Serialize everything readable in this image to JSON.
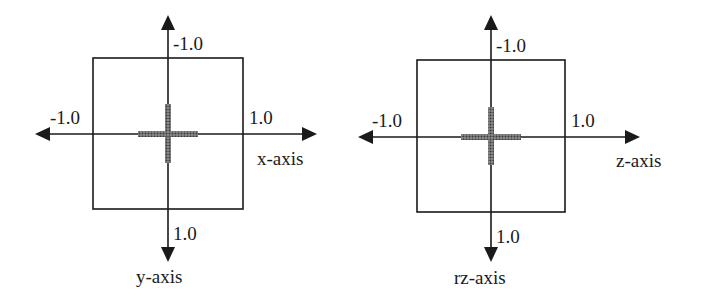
{
  "colors": {
    "line": "#1a1a1a",
    "cross": "#555555",
    "background": "#ffffff"
  },
  "diagrams": [
    {
      "id": "xy",
      "horizontal_axis_label": "x-axis",
      "vertical_axis_label": "y-axis",
      "top_tick": "-1.0",
      "bottom_tick": "1.0",
      "left_tick": "-1.0",
      "right_tick": "1.0"
    },
    {
      "id": "z-rz",
      "horizontal_axis_label": "z-axis",
      "vertical_axis_label": "rz-axis",
      "top_tick": "-1.0",
      "bottom_tick": "1.0",
      "left_tick": "-1.0",
      "right_tick": "1.0"
    }
  ]
}
